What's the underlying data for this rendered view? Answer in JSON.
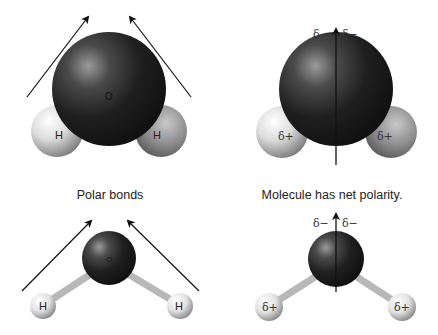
{
  "figure": {
    "panels": [
      {
        "id": "space-filling-bonds",
        "oxygen_label": "O",
        "hydrogen_labels": [
          "H",
          "H"
        ],
        "arrows": "bond dipoles pointing toward oxygen"
      },
      {
        "id": "space-filling-net",
        "partial_negative_labels": [
          "δ−",
          "δ−"
        ],
        "partial_positive_labels": [
          "δ+",
          "δ+"
        ],
        "arrows": "net dipole vertical upward"
      },
      {
        "id": "ball-and-stick-bonds",
        "oxygen_label": "O",
        "hydrogen_labels": [
          "H",
          "H"
        ]
      },
      {
        "id": "ball-and-stick-net",
        "partial_negative_labels": [
          "δ−",
          "δ−"
        ],
        "partial_positive_labels": [
          "δ+",
          "δ+"
        ]
      }
    ],
    "captions": {
      "left": "Polar bonds",
      "right": "Molecule has net polarity."
    }
  },
  "colors": {
    "oxygen_dark": "#1a1a1a",
    "oxygen_highlight": "#8a8a8a",
    "hydrogen_light": "#f2f2f2",
    "hydrogen_shadow": "#7a7a7a",
    "arrow": "#111111",
    "bond_stick": "#c8c8c8"
  }
}
